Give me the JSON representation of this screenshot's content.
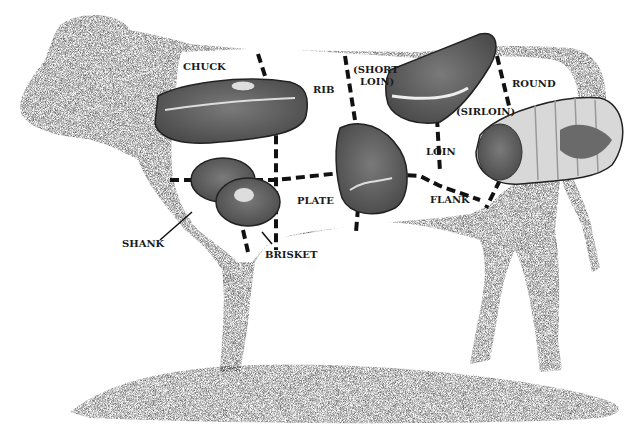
{
  "diagram": {
    "colors": {
      "body": "#2c2c2c",
      "meat": "#6a6a6a",
      "fat": "#e6e6e6",
      "background": "#ffffff",
      "ground": "#3a3a3a"
    },
    "labels": {
      "chuck": "CHUCK",
      "rib": "RIB",
      "short_loin_1": "(SHORT",
      "short_loin_2": "LOIN)",
      "round": "ROUND",
      "sirloin": "(SIRLOIN)",
      "loin": "LOIN",
      "plate": "PLATE",
      "flank": "FLANK",
      "shank": "SHANK",
      "brisket": "BRISKET"
    }
  }
}
